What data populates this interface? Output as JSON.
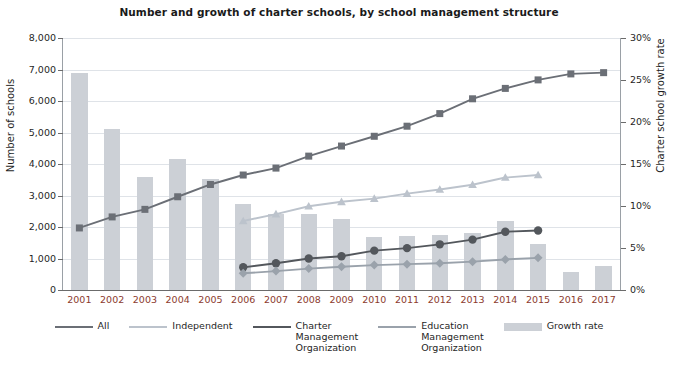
{
  "chart_data": {
    "type": "line",
    "title": "Number and growth of charter schools, by school management structure",
    "xlabel": "",
    "ylabel": "Number of schools",
    "y2label": "Charter school growth rate",
    "categories": [
      "2001",
      "2002",
      "2003",
      "2004",
      "2005",
      "2006",
      "2007",
      "2008",
      "2009",
      "2010",
      "2011",
      "2012",
      "2013",
      "2014",
      "2015",
      "2016",
      "2017"
    ],
    "ylim": [
      0,
      8000
    ],
    "y2lim": [
      0,
      30
    ],
    "yticks": [
      "0",
      "1,000",
      "2,000",
      "3,000",
      "4,000",
      "5,000",
      "6,000",
      "7,000",
      "8,000"
    ],
    "ytick_values": [
      0,
      1000,
      2000,
      3000,
      4000,
      5000,
      6000,
      7000,
      8000
    ],
    "y2ticks": [
      "0%",
      "5%",
      "10%",
      "15%",
      "20%",
      "25%",
      "30%"
    ],
    "y2tick_values": [
      0,
      5,
      10,
      15,
      20,
      25,
      30
    ],
    "grid": true,
    "legend_position": "bottom",
    "series": [
      {
        "name": "All",
        "kind": "line",
        "marker": "square",
        "color": "#6b6f76",
        "axis": "left",
        "values": [
          1970,
          2320,
          2560,
          2960,
          3350,
          3650,
          3870,
          4250,
          4570,
          4880,
          5200,
          5600,
          6070,
          6400,
          6670,
          6860,
          6900
        ]
      },
      {
        "name": "Independent",
        "kind": "line",
        "marker": "triangle",
        "color": "#bcc3cc",
        "axis": "left",
        "values": [
          null,
          null,
          null,
          null,
          null,
          2190,
          2410,
          2660,
          2800,
          2900,
          3060,
          3190,
          3340,
          3570,
          3650,
          null,
          null
        ]
      },
      {
        "name": "Charter\nManagement\nOrganization",
        "kind": "line",
        "marker": "circle",
        "color": "#53575c",
        "axis": "left",
        "values": [
          null,
          null,
          null,
          null,
          null,
          720,
          850,
          1000,
          1070,
          1250,
          1330,
          1450,
          1600,
          1850,
          1890,
          null,
          null
        ]
      },
      {
        "name": "Education\nManagement\nOrganization",
        "kind": "line",
        "marker": "diamond",
        "color": "#9aa2ab",
        "axis": "left",
        "values": [
          null,
          null,
          null,
          null,
          null,
          530,
          600,
          680,
          740,
          790,
          820,
          850,
          900,
          970,
          1020,
          null,
          null
        ]
      },
      {
        "name": "Growth rate",
        "kind": "bar",
        "color": "#ccd0d6",
        "axis": "right",
        "values": [
          25.8,
          19.2,
          13.5,
          15.6,
          13.2,
          10.2,
          9.0,
          9.0,
          8.5,
          6.3,
          6.4,
          6.5,
          6.8,
          8.2,
          5.5,
          2.1,
          2.9
        ]
      }
    ],
    "legend": [
      {
        "label": "All",
        "marker": "square",
        "color": "#6b6f76"
      },
      {
        "label": "Independent",
        "marker": "triangle",
        "color": "#bcc3cc"
      },
      {
        "label": "Charter\nManagement\nOrganization",
        "marker": "circle",
        "color": "#53575c"
      },
      {
        "label": "Education\nManagement\nOrganization",
        "marker": "diamond",
        "color": "#9aa2ab"
      },
      {
        "label": "Growth rate",
        "marker": "bar",
        "color": "#ccd0d6"
      }
    ]
  },
  "colors": {
    "bar": "#ccd0d6",
    "all": "#6b6f76",
    "independent": "#bcc3cc",
    "cmo": "#53575c",
    "emo": "#9aa2ab",
    "xtick": "#8c3b2e",
    "grid": "#dfe3e8",
    "text": "#1f1f1f"
  }
}
